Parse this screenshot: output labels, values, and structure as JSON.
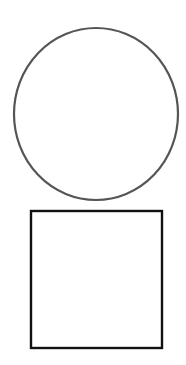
{
  "shapes": {
    "circle": {
      "type": "circle",
      "cx": 96,
      "cy": 114,
      "rx": 82,
      "ry": 86,
      "stroke": "#555555",
      "stroke_width": 2.2,
      "fill": "#ffffff"
    },
    "square": {
      "type": "square",
      "x": 31,
      "y": 211,
      "width": 131,
      "height": 137,
      "stroke": "#111111",
      "stroke_width": 2.4,
      "fill": "#ffffff"
    }
  }
}
